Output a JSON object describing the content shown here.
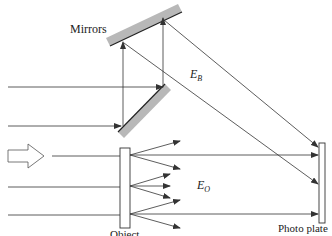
{
  "labels": {
    "mirrors": "Mirrors",
    "object": "Object",
    "photo_plate": "Photo plate",
    "reference_beam": "E",
    "reference_beam_sub": "B",
    "object_beam": "E",
    "object_beam_sub": "O"
  },
  "colors": {
    "line": "#333333",
    "mirror_fill": "#b8b8b8",
    "mirror_edge": "#222222",
    "background": "#ffffff"
  }
}
